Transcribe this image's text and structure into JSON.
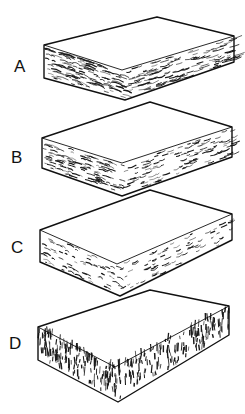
{
  "figure": {
    "colors": {
      "line": "#111111",
      "background": "#ffffff",
      "texture": "#1a1a1a"
    },
    "slabs": [
      {
        "label": "A",
        "texture": "wavy-horizontal-streaks",
        "label_pos": [
          14,
          58
        ],
        "pts": {
          "back": [
            157,
            17
          ],
          "right": [
            234,
            36
          ],
          "left": [
            44,
            45
          ],
          "front": [
            122,
            70
          ],
          "leftB": [
            44,
            78
          ],
          "frontB": [
            125,
            100
          ],
          "rightB": [
            234,
            62
          ]
        }
      },
      {
        "label": "B",
        "texture": "fine-horizontal-layers",
        "label_pos": [
          11,
          149
        ],
        "pts": {
          "back": [
            150,
            102
          ],
          "right": [
            232,
            127
          ],
          "left": [
            42,
            138
          ],
          "front": [
            122,
            163
          ],
          "leftB": [
            42,
            168
          ],
          "frontB": [
            122,
            196
          ],
          "rightB": [
            232,
            157
          ]
        }
      },
      {
        "label": "C",
        "texture": "sparse-horizontal-flecks",
        "label_pos": [
          11,
          239
        ],
        "pts": {
          "back": [
            150,
            190
          ],
          "right": [
            232,
            214
          ],
          "left": [
            40,
            230
          ],
          "front": [
            117,
            264
          ],
          "leftB": [
            40,
            262
          ],
          "frontB": [
            120,
            296
          ],
          "rightB": [
            232,
            240
          ]
        }
      },
      {
        "label": "D",
        "texture": "vertical-fibrous-streaks",
        "label_pos": [
          9,
          335
        ],
        "pts": {
          "back": [
            150,
            290
          ],
          "right": [
            229,
            306
          ],
          "left": [
            38,
            327
          ],
          "front": [
            115,
            367
          ],
          "leftB": [
            38,
            360
          ],
          "frontB": [
            118,
            402
          ],
          "rightB": [
            229,
            335
          ]
        }
      }
    ]
  }
}
